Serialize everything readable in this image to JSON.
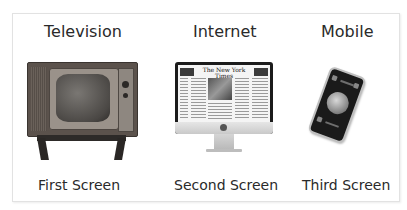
{
  "columns": [
    {
      "heading": "Television",
      "caption": "First Screen",
      "icon": "television-icon"
    },
    {
      "heading": "Internet",
      "caption": "Second Screen",
      "icon": "imac-computer-icon"
    },
    {
      "heading": "Mobile",
      "caption": "Third Screen",
      "icon": "smartphone-icon"
    }
  ],
  "imac_screen": {
    "masthead": "The New York Times"
  },
  "colors": {
    "text": "#2a2a2a",
    "frame_border": "#e2e2e2",
    "background": "#ffffff"
  }
}
